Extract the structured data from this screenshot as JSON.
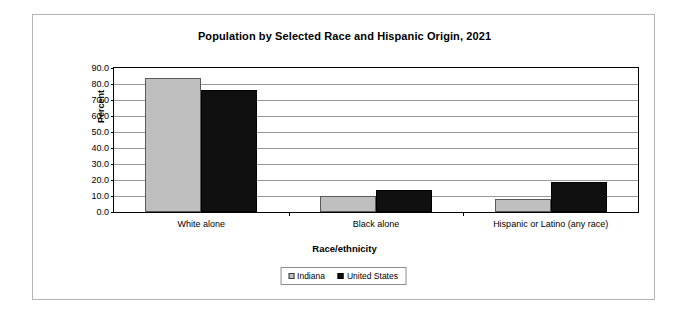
{
  "chart_data": {
    "type": "bar",
    "title": "Population by Selected Race and Hispanic Origin, 2021",
    "xlabel": "Race/ethnicity",
    "ylabel": "Percent",
    "categories": [
      "White alone",
      "Black alone",
      "Hispanic or Latino (any race)"
    ],
    "series": [
      {
        "name": "Indiana",
        "color": "#bfbfbf",
        "values": [
          84.0,
          10.3,
          8.0
        ]
      },
      {
        "name": "United States",
        "color": "#101010",
        "values": [
          76.3,
          13.6,
          18.9
        ]
      }
    ],
    "ylim": [
      0.0,
      90.0
    ],
    "ytick_labels": [
      "90.0",
      "80.0",
      "70.0",
      "60.0",
      "50.0",
      "40.0",
      "30.0",
      "20.0",
      "10.0",
      "0.0"
    ],
    "ytick_values": [
      90.0,
      80.0,
      70.0,
      60.0,
      50.0,
      40.0,
      30.0,
      20.0,
      10.0,
      0.0
    ],
    "grid": true,
    "legend_position": "bottom",
    "legend_entries": [
      "Indiana",
      "United States"
    ]
  }
}
